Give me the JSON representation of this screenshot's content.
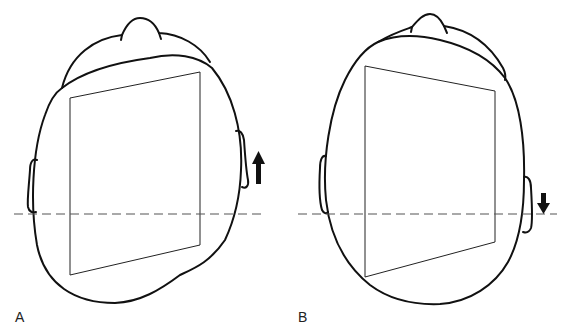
{
  "figure": {
    "panels": [
      {
        "label": "A",
        "arrow_direction": "up",
        "frame_shape": "trapezoid, left edge shorter at top-left, right edge higher",
        "reference_line": "dashed horizontal"
      },
      {
        "label": "B",
        "arrow_direction": "down",
        "frame_shape": "trapezoid, left edge taller, right edge lower",
        "reference_line": "dashed horizontal"
      }
    ]
  },
  "colors": {
    "line": "#111111",
    "dashed": "#555555",
    "background": "#ffffff"
  }
}
